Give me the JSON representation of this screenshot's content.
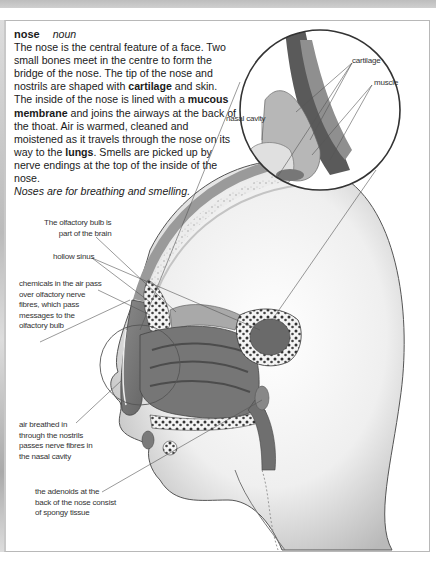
{
  "entry": {
    "headword": "nose",
    "part_of_speech": "noun",
    "definition": {
      "p1": "The nose is the central feature of a face. Two small bones meet in the centre to form the bridge of the nose. The tip of the nose and nostrils are shaped with ",
      "term_cartilage": "cartilage",
      "p2": " and skin. The inside of the nose is lined with a ",
      "term_mucous": "mucous membrane",
      "p3": " and joins the airways at the back of the thoat. Air is warmed, cleaned and moistened as it travels through the nose on its way to the ",
      "term_lungs": "lungs",
      "p4": ". Smells are picked up by nerve endings at the top of the inside of the nose."
    },
    "tagline": "Noses are for breathing and smelling."
  },
  "illustration": {
    "inset_labels": {
      "cartilage": "cartilage",
      "muscle": "muscle",
      "nasal_cavity": "nasal cavity"
    },
    "labels": {
      "olfactory_bulb": [
        "The olfactory bulb is",
        "part of the brain"
      ],
      "hollow_sinus": [
        "hollow sinus"
      ],
      "chemicals": [
        "chemicals in the air pass",
        "over olfactory nerve",
        "fibres, which pass",
        "messages to the",
        "olfactory bulb"
      ],
      "air_breathed": [
        "air breathed in",
        "through the nostrils",
        "passes nerve fibres in",
        "the nasal cavity"
      ],
      "adenoids": [
        "the adenoids at the",
        "back of the nose consist",
        "of spongy tissue"
      ]
    }
  },
  "colors": {
    "text": "#1a1a1a",
    "frame": "#b8b8b8",
    "line": "#555555",
    "tissue_dark": "#6e6e6e",
    "tissue_mid": "#9a9a9a",
    "skin": "#e4e4e4"
  }
}
